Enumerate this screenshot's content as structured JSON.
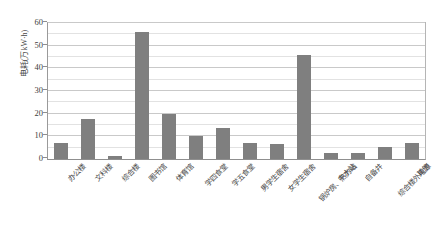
{
  "chart_data": {
    "type": "bar",
    "title": "",
    "xlabel": "",
    "ylabel": "电耗(万kW·h)",
    "ylim": [
      0,
      60
    ],
    "ytick_values": [
      0,
      10,
      20,
      30,
      40,
      50,
      60
    ],
    "ytick_labels": [
      "0",
      "10",
      "20",
      "30",
      "40",
      "50",
      "60"
    ],
    "minor_gridline_step": 5,
    "grid": true,
    "legend": "none",
    "bar_color": "#7f7f7f",
    "categories": [
      "办公楼",
      "文科楼",
      "综合楼",
      "图书馆",
      "体育馆",
      "学四食堂",
      "学五食堂",
      "男学生宿舍",
      "女学生宿舍",
      "锅炉房、热力站",
      "中水站",
      "自备井",
      "综合楼外电源",
      "其他"
    ],
    "values": [
      7,
      17.5,
      1.5,
      56,
      20,
      10,
      13.5,
      7,
      6.5,
      46,
      2.5,
      2.5,
      5.5,
      7
    ]
  },
  "axis": {
    "y_title": "电耗(万kW·h)"
  }
}
